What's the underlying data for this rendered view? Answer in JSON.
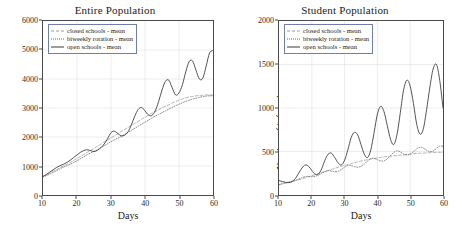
{
  "figure": {
    "panel_count": 2
  },
  "chart_data": [
    {
      "type": "line",
      "title": "Entire Population",
      "xlabel": "Days",
      "ylabel": "Number of infected agents",
      "xlim": [
        10,
        60
      ],
      "ylim": [
        0,
        6000
      ],
      "xticks": [
        10,
        20,
        30,
        40,
        50,
        60
      ],
      "yticks": [
        0,
        1000,
        2000,
        3000,
        4000,
        5000,
        6000
      ],
      "grid": true,
      "legend_position": "upper left",
      "x": [
        10,
        11,
        12,
        13,
        14,
        15,
        16,
        17,
        18,
        19,
        20,
        21,
        22,
        23,
        24,
        25,
        26,
        27,
        28,
        29,
        30,
        31,
        32,
        33,
        34,
        35,
        36,
        37,
        38,
        39,
        40,
        41,
        42,
        43,
        44,
        45,
        46,
        47,
        48,
        49,
        50,
        51,
        52,
        53,
        54,
        55,
        56,
        57,
        58,
        59,
        60
      ],
      "series": [
        {
          "name": "closed schools - mean",
          "style": "dashed",
          "color": "#a0a0a0",
          "values": [
            640,
            700,
            760,
            820,
            880,
            940,
            1000,
            1060,
            1120,
            1190,
            1260,
            1330,
            1400,
            1470,
            1540,
            1610,
            1680,
            1750,
            1830,
            1900,
            1970,
            2040,
            2110,
            2190,
            2260,
            2330,
            2400,
            2470,
            2540,
            2610,
            2680,
            2750,
            2820,
            2880,
            2940,
            3000,
            3060,
            3110,
            3170,
            3220,
            3270,
            3310,
            3350,
            3380,
            3400,
            3420,
            3430,
            3440,
            3450,
            3450,
            3450
          ]
        },
        {
          "name": "biweekly rotation - mean",
          "style": "dotted",
          "color": "#6b6b6b",
          "values": [
            620,
            670,
            720,
            780,
            840,
            900,
            960,
            1010,
            1060,
            1120,
            1180,
            1250,
            1320,
            1390,
            1450,
            1500,
            1560,
            1630,
            1700,
            1770,
            1840,
            1900,
            1960,
            2020,
            2090,
            2160,
            2230,
            2300,
            2370,
            2440,
            2510,
            2580,
            2650,
            2720,
            2780,
            2840,
            2900,
            2960,
            3020,
            3080,
            3130,
            3180,
            3230,
            3270,
            3310,
            3340,
            3370,
            3390,
            3410,
            3420,
            3420
          ]
        },
        {
          "name": "open schools - mean",
          "style": "solid",
          "color": "#333333",
          "values": [
            640,
            710,
            790,
            870,
            950,
            1010,
            1060,
            1120,
            1200,
            1290,
            1380,
            1470,
            1530,
            1560,
            1530,
            1500,
            1540,
            1630,
            1760,
            1940,
            2150,
            2200,
            2120,
            2040,
            2060,
            2180,
            2420,
            2720,
            2950,
            3020,
            2900,
            2760,
            2740,
            2900,
            3220,
            3620,
            3920,
            3960,
            3700,
            3450,
            3520,
            3800,
            4250,
            4600,
            4620,
            4300,
            4000,
            4030,
            4450,
            4900,
            4980
          ]
        }
      ]
    },
    {
      "type": "line",
      "title": "Student Population",
      "xlabel": "Days",
      "ylabel": "Number of infected agents",
      "xlim": [
        10,
        60
      ],
      "ylim": [
        0,
        2000
      ],
      "xticks": [
        10,
        20,
        30,
        40,
        50,
        60
      ],
      "yticks": [
        0,
        500,
        1000,
        1500,
        2000
      ],
      "grid": true,
      "legend_position": "upper left",
      "x": [
        10,
        11,
        12,
        13,
        14,
        15,
        16,
        17,
        18,
        19,
        20,
        21,
        22,
        23,
        24,
        25,
        26,
        27,
        28,
        29,
        30,
        31,
        32,
        33,
        34,
        35,
        36,
        37,
        38,
        39,
        40,
        41,
        42,
        43,
        44,
        45,
        46,
        47,
        48,
        49,
        50,
        51,
        52,
        53,
        54,
        55,
        56,
        57,
        58,
        59,
        60
      ],
      "series": [
        {
          "name": "closed schools - mean",
          "style": "dashed",
          "color": "#a0a0a0",
          "values": [
            115,
            125,
            135,
            145,
            155,
            165,
            175,
            185,
            198,
            210,
            222,
            234,
            246,
            258,
            270,
            282,
            294,
            306,
            318,
            330,
            340,
            350,
            360,
            370,
            380,
            390,
            398,
            406,
            414,
            420,
            426,
            432,
            438,
            442,
            446,
            450,
            454,
            458,
            462,
            466,
            470,
            474,
            478,
            480,
            482,
            484,
            486,
            488,
            489,
            490,
            490
          ]
        },
        {
          "name": "biweekly rotation - mean",
          "style": "dotted",
          "color": "#6b6b6b",
          "values": [
            120,
            132,
            142,
            150,
            158,
            168,
            182,
            200,
            210,
            212,
            210,
            215,
            228,
            248,
            268,
            280,
            275,
            268,
            272,
            292,
            320,
            340,
            338,
            326,
            320,
            330,
            355,
            392,
            418,
            420,
            405,
            392,
            392,
            415,
            452,
            490,
            508,
            495,
            472,
            460,
            470,
            498,
            530,
            548,
            540,
            515,
            498,
            505,
            535,
            562,
            560
          ]
        },
        {
          "name": "open schools - mean",
          "style": "solid",
          "color": "#333333",
          "values": [
            165,
            155,
            145,
            142,
            155,
            190,
            250,
            310,
            345,
            330,
            282,
            240,
            240,
            300,
            400,
            470,
            480,
            430,
            370,
            345,
            400,
            520,
            660,
            720,
            690,
            580,
            470,
            430,
            520,
            720,
            930,
            1020,
            960,
            800,
            640,
            580,
            700,
            950,
            1210,
            1320,
            1250,
            1050,
            810,
            700,
            760,
            980,
            1240,
            1450,
            1500,
            1320,
            1000
          ]
        }
      ]
    }
  ]
}
